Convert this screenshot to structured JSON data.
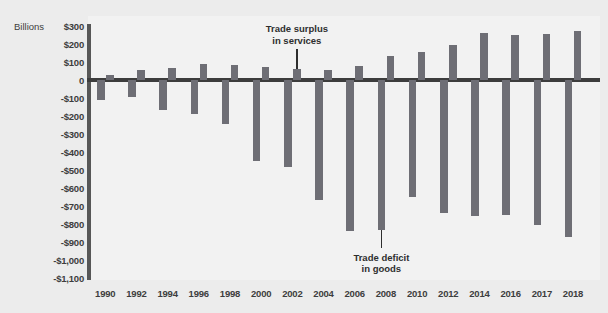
{
  "chart_data": {
    "type": "bar",
    "title": "",
    "subtitle": "",
    "unit_label": "Billions",
    "xlabel": "",
    "ylabel": "",
    "grid": false,
    "legend_position": "none",
    "ylim": [
      -1100,
      300
    ],
    "y_ticks": [
      "$300",
      "$200",
      "$100",
      "0",
      "-$100",
      "-$200",
      "-$300",
      "-$400",
      "-$500",
      "-$600",
      "-$700",
      "-$800",
      "-$900",
      "-$1,000",
      "-$1,100"
    ],
    "y_tick_values": [
      300,
      200,
      100,
      0,
      -100,
      -200,
      -300,
      -400,
      -500,
      -600,
      -700,
      -800,
      -900,
      -1000,
      -1100
    ],
    "categories": [
      "1990",
      "1992",
      "1994",
      "1996",
      "1998",
      "2000",
      "2002",
      "2004",
      "2006",
      "2008",
      "2010",
      "2012",
      "2014",
      "2016",
      "2017",
      "2018"
    ],
    "series": [
      {
        "name": "Trade deficit in goods",
        "color": "#6e6e75",
        "values": [
          -110,
          -96,
          -166,
          -191,
          -247,
          -452,
          -482,
          -665,
          -838,
          -832,
          -649,
          -741,
          -757,
          -752,
          -807,
          -872
        ]
      },
      {
        "name": "Trade surplus in services",
        "color": "#6e6e75",
        "values": [
          30,
          56,
          67,
          87,
          82,
          74,
          61,
          55,
          79,
          136,
          154,
          195,
          262,
          248,
          255,
          270
        ]
      }
    ],
    "annotations": [
      {
        "id": "trade-surplus-in-services",
        "line1": "Trade surplus",
        "line2": "in services",
        "points_to_category": "2002",
        "points_to_series": "Trade surplus in services"
      },
      {
        "id": "trade-deficit-in-goods",
        "line1": "Trade deficit",
        "line2": "in goods",
        "points_to_category": "2008",
        "points_to_series": "Trade deficit in goods"
      }
    ],
    "colors": {
      "background": "#ececec",
      "plot_background": "#f2f2f2",
      "bar": "#6e6e75",
      "axis": "#3d3d3d",
      "text": "#3d3d3d"
    }
  }
}
